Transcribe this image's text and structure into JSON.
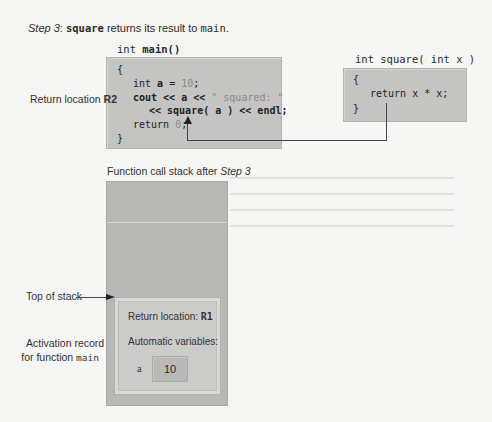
{
  "caption": {
    "step_label": "Step 3",
    "colon": ": ",
    "fn_name": "square",
    "middle_text": " returns its result to ",
    "target": "main",
    "period": "."
  },
  "main_function": {
    "signature_prefix": "int ",
    "signature_name": "main()",
    "lines": {
      "open_brace": "{",
      "decl_prefix": "int ",
      "decl_var": "a",
      "decl_eq": " = ",
      "decl_value": "10",
      "decl_end": ";",
      "cout_prefix": "cout << a << ",
      "cout_string": "\" squared: \"",
      "call_line": "<< square( a ) << endl;",
      "return_prefix": "return ",
      "return_value": "0",
      "return_end": ";",
      "close_brace": "}"
    }
  },
  "square_function": {
    "signature": "int square( int x )",
    "lines": {
      "open_brace": "{",
      "body": "return x * x;",
      "close_brace": "}"
    }
  },
  "return_location_label": {
    "text": "Return location ",
    "id": "R2"
  },
  "stack": {
    "title_prefix": "Function call stack after ",
    "title_step": "Step 3",
    "top_of_stack_label": "Top of stack",
    "activation_label_line1": "Activation record",
    "activation_label_line2_prefix": "for function ",
    "activation_label_fn": "main",
    "record": {
      "return_location_prefix": "Return location: ",
      "return_location_id": "R1",
      "auto_vars_label": "Automatic variables:",
      "variables": [
        {
          "name": "a",
          "value": "10"
        }
      ]
    }
  },
  "colors": {
    "background": "#f6f6f4",
    "code_box": "#c4c4c2",
    "stack_fill": "#b8b8b6",
    "record_fill": "#cbcbc9",
    "arrow": "#222222"
  }
}
